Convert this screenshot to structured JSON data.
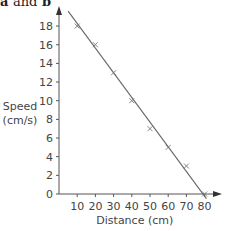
{
  "heading": {
    "part_a": "a",
    "connector": "and",
    "part_b": "b"
  },
  "chart_data": {
    "type": "scatter",
    "title": "",
    "xlabel": "Distance (cm)",
    "ylabel_line1": "Speed",
    "ylabel_line2": "(cm/s)",
    "x_ticks": [
      10,
      20,
      30,
      40,
      50,
      60,
      70,
      80
    ],
    "y_ticks": [
      0,
      2,
      4,
      6,
      8,
      10,
      12,
      14,
      16,
      18
    ],
    "xlim": [
      0,
      85
    ],
    "ylim": [
      0,
      19.5
    ],
    "grid": false,
    "points": [
      {
        "x": 10,
        "y": 18
      },
      {
        "x": 20,
        "y": 16
      },
      {
        "x": 30,
        "y": 13
      },
      {
        "x": 40,
        "y": 10
      },
      {
        "x": 50,
        "y": 7
      },
      {
        "x": 60,
        "y": 5
      },
      {
        "x": 70,
        "y": 3
      },
      {
        "x": 80,
        "y": 0
      }
    ],
    "line_of_best_fit": {
      "x1": 5,
      "y1": 19.6,
      "x2": 81,
      "y2": -0.5
    },
    "marker": "x",
    "colors": {
      "axis": "#555555",
      "line": "#666666",
      "marker": "#777777"
    }
  }
}
